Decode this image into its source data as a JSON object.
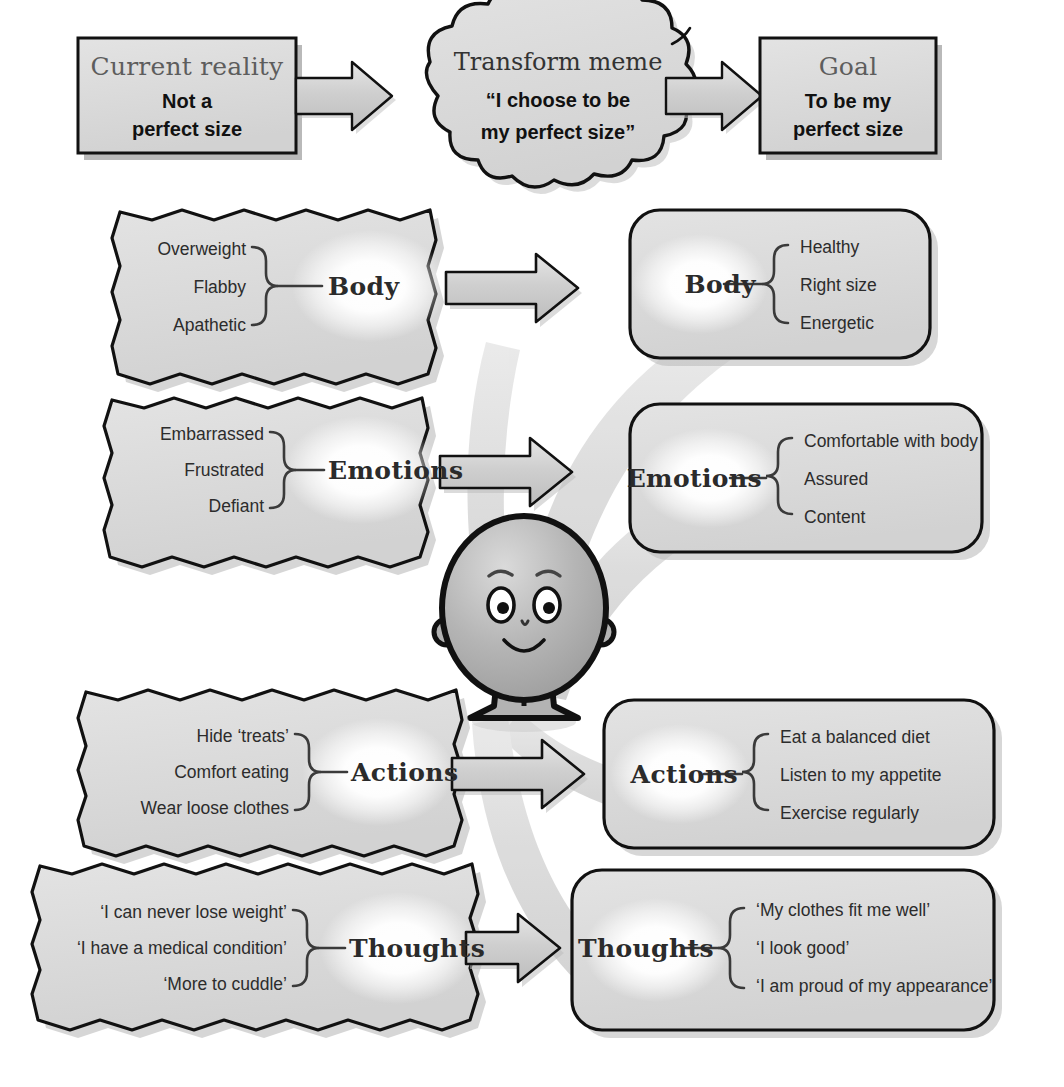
{
  "diagram": {
    "colors": {
      "box_fill": "#dcdcdc",
      "box_fill_light": "#e4e4e4",
      "outline": "#111111",
      "shadow": "#b9b9b9",
      "ribbon": "#d6d6d6",
      "arrow_fill": "#c9c9c9",
      "glow": "#ffffff",
      "head_text": "#5d5d5d",
      "body_text": "#111111",
      "character_fill": "#b0b0b0"
    }
  },
  "top_row": {
    "current_reality": {
      "heading": "Current reality",
      "lines": [
        "Not a",
        "perfect size"
      ]
    },
    "transform_meme": {
      "heading": "Transform meme",
      "lines": [
        "“I choose to be",
        "my perfect size”"
      ]
    },
    "goal": {
      "heading": "Goal",
      "lines": [
        "To be my",
        "perfect size"
      ]
    },
    "arrow1_name": "arrow-current-to-meme",
    "arrow2_name": "arrow-meme-to-goal"
  },
  "rows": [
    {
      "key": "body",
      "label": "Body",
      "left_items": [
        "Overweight",
        "Flabby",
        "Apathetic"
      ],
      "right_items": [
        "Healthy",
        "Right size",
        "Energetic"
      ]
    },
    {
      "key": "emotions",
      "label": "Emotions",
      "left_items": [
        "Embarrassed",
        "Frustrated",
        "Defiant"
      ],
      "right_items": [
        "Comfortable with body",
        "Assured",
        "Content"
      ]
    },
    {
      "key": "actions",
      "label": "Actions",
      "left_items": [
        "Hide ‘treats’",
        "Comfort eating",
        "Wear loose clothes"
      ],
      "right_items": [
        "Eat a balanced diet",
        "Listen to my appetite",
        "Exercise regularly"
      ]
    },
    {
      "key": "thoughts",
      "label": "Thoughts",
      "left_items": [
        "‘I can never lose weight’",
        "‘I have a medical condition’",
        "‘More to cuddle’"
      ],
      "right_items": [
        "‘My clothes fit me well’",
        "‘I look good’",
        "‘I am proud of my appearance’"
      ]
    }
  ],
  "character": {
    "name": "Smiling round character with eyes, nose, smile, ears and legs"
  },
  "icons": {
    "arrow_right": "arrow-right-icon",
    "brace_right": "brace-icon",
    "cloud": "cloud-icon",
    "torn_box": "torn-box-icon"
  }
}
